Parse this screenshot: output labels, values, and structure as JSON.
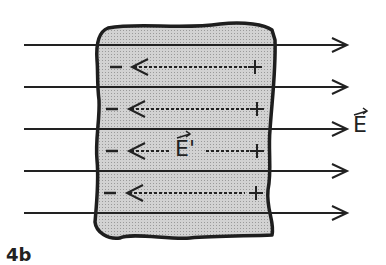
{
  "diagram": {
    "figure_label": "4b",
    "external_field_label": "E",
    "induced_field_label": "E'",
    "negative_sign": "−",
    "positive_sign": "+",
    "field_lines_count": 5,
    "induced_arrows_count": 4,
    "colors": {
      "line": "#222222",
      "slab_fill": "#c8c8c8",
      "background": "#ffffff"
    }
  }
}
